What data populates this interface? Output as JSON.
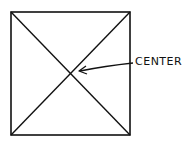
{
  "diagram": {
    "label": "CENTER",
    "stroke_color": "#111111",
    "background": "#ffffff"
  }
}
